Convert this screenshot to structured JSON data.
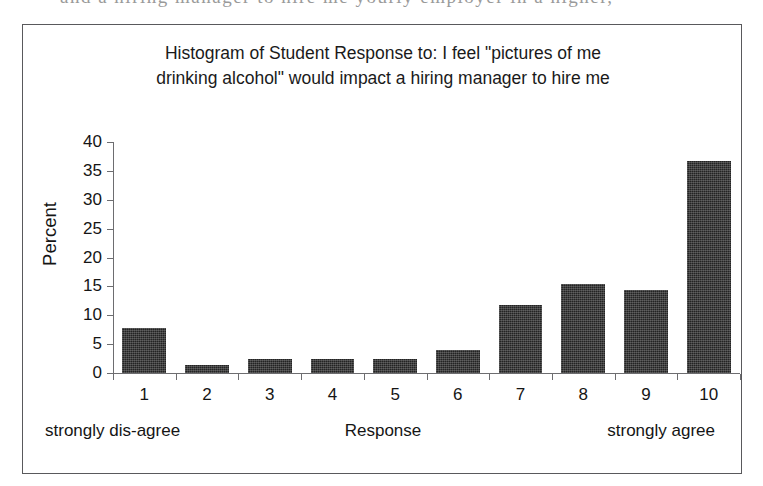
{
  "page_bleed": {
    "text": "and  a  hiring  manager  to  hire  me  yourly  employer  in  a  higher,"
  },
  "chart_data": {
    "type": "bar",
    "title": "Histogram of Student Response to: I feel \"pictures of me drinking alcohol\" would impact a hiring manager to hire me",
    "title_lines": [
      "Histogram of Student Response to: I feel \"pictures of me",
      "drinking alcohol\" would impact a hiring manager to hire me"
    ],
    "xlabel": "Response",
    "ylabel": "Percent",
    "categories": [
      "1",
      "2",
      "3",
      "4",
      "5",
      "6",
      "7",
      "8",
      "9",
      "10"
    ],
    "values": [
      7.8,
      1.3,
      2.5,
      2.5,
      2.5,
      4.0,
      11.8,
      15.4,
      14.3,
      36.7
    ],
    "ylim": [
      0,
      40
    ],
    "ytick_values": [
      0,
      5,
      10,
      15,
      20,
      25,
      30,
      35,
      40
    ],
    "ytick_labels": [
      "0",
      "5",
      "10",
      "15",
      "20",
      "25",
      "30",
      "35",
      "40"
    ],
    "grid": false,
    "legend": false,
    "bar_color": "#232323",
    "axis_color": "#6d6d70",
    "scale_captions": {
      "left": "strongly dis-agree",
      "middle": "Response",
      "right": "strongly agree"
    }
  }
}
